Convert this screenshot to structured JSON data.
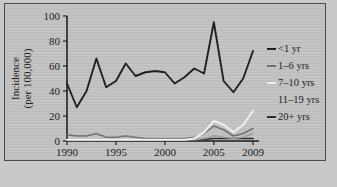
{
  "chart_data": {
    "type": "line",
    "title": "",
    "xlabel": "Year",
    "ylabel": "Incidence (per 100,000)",
    "ylabel_line1": "Incidence",
    "ylabel_line2": "(per 100,000)",
    "xlim": [
      1990,
      2009
    ],
    "ylim": [
      0,
      100
    ],
    "grid": false,
    "legend_position": "right",
    "xticks": [
      1990,
      1995,
      2000,
      2005,
      2009
    ],
    "xtick_labels": [
      "1990",
      "1995",
      "2000",
      "2005",
      "2009"
    ],
    "yticks": [
      0,
      20,
      40,
      60,
      80,
      100
    ],
    "ytick_labels": [
      "0",
      "20",
      "40",
      "60",
      "80",
      "100"
    ],
    "x": [
      1990,
      1991,
      1992,
      1993,
      1994,
      1995,
      1996,
      1997,
      1998,
      1999,
      2000,
      2001,
      2002,
      2003,
      2004,
      2005,
      2006,
      2007,
      2008,
      2009
    ],
    "series": [
      {
        "name": "<1 yr",
        "color": "#1a1a1a",
        "width": 1.9,
        "values": [
          46,
          27,
          40,
          66,
          43,
          48,
          62,
          52,
          55,
          56,
          55,
          46,
          51,
          58,
          54,
          95,
          48,
          39,
          50,
          72
        ]
      },
      {
        "name": "1-6 yrs",
        "color": "#6f6f6f",
        "width": 1.5,
        "values": [
          5,
          4,
          4,
          6,
          3,
          3,
          4,
          3,
          2,
          2,
          2,
          2,
          2,
          3,
          6,
          12,
          9,
          4,
          6,
          10
        ]
      },
      {
        "name": "7-10 yrs",
        "color": "#f2f2f2",
        "width": 2.1,
        "values": [
          1,
          1,
          1,
          1,
          1,
          1,
          1,
          1,
          1,
          1,
          1,
          1,
          1,
          2,
          7,
          16,
          13,
          7,
          13,
          24
        ]
      },
      {
        "name": "11-19 yrs",
        "color": "#9a9a9a",
        "width": 1.4,
        "values": [
          1,
          1,
          1,
          1,
          1,
          1,
          1,
          1,
          1,
          1,
          1,
          1,
          1,
          1,
          2,
          4,
          3,
          2,
          3,
          6
        ]
      },
      {
        "name": "20+ yrs",
        "color": "#2a2a2a",
        "width": 1.6,
        "values": [
          1,
          1,
          1,
          1,
          1,
          1,
          1,
          1,
          1,
          1,
          1,
          1,
          1,
          1,
          1,
          2,
          2,
          2,
          2,
          2
        ]
      }
    ],
    "legend": [
      {
        "label": "<1 yr",
        "color": "#1a1a1a",
        "marker": true
      },
      {
        "label": "1–6 yrs",
        "color": "#6f6f6f",
        "marker": true
      },
      {
        "label": "7–10 yrs",
        "color": "#f2f2f2",
        "marker": true
      },
      {
        "label": "11–19 yrs",
        "color": "#9a9a9a",
        "marker": false
      },
      {
        "label": "20+ yrs",
        "color": "#2a2a2a",
        "marker": true
      }
    ]
  }
}
